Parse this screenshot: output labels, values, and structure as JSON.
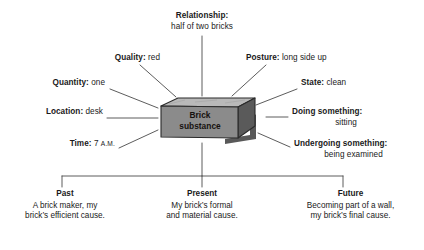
{
  "diagram": {
    "title_subject": {
      "line1": "Brick",
      "line2": "substance"
    },
    "radial_labels": [
      {
        "id": "relationship",
        "term": "Relationship:",
        "value": "half of two bricks",
        "position": "top-center",
        "layout": "stacked"
      },
      {
        "id": "quality",
        "term": "Quality:",
        "value": "red",
        "position": "upper-left",
        "layout": "inline"
      },
      {
        "id": "posture",
        "term": "Posture:",
        "value": "long side up",
        "position": "upper-right",
        "layout": "inline"
      },
      {
        "id": "quantity",
        "term": "Quantity:",
        "value": "one",
        "position": "left",
        "layout": "inline"
      },
      {
        "id": "state",
        "term": "State:",
        "value": "clean",
        "position": "right",
        "layout": "inline"
      },
      {
        "id": "location",
        "term": "Location:",
        "value": "desk",
        "position": "mid-left",
        "layout": "inline"
      },
      {
        "id": "doing-something",
        "term": "Doing something:",
        "value": "sitting",
        "position": "mid-right",
        "layout": "stacked"
      },
      {
        "id": "time",
        "term": "Time:",
        "value": "7",
        "value_smallcaps": "A.M.",
        "position": "lower-left",
        "layout": "inline"
      },
      {
        "id": "undergoing-something",
        "term": "Undergoing something:",
        "value": "being examined",
        "position": "lower-right",
        "layout": "stacked"
      }
    ],
    "time_branches": [
      {
        "id": "past",
        "heading": "Past",
        "line1": "A brick maker, my",
        "line2": "brick’s efficient cause."
      },
      {
        "id": "present",
        "heading": "Present",
        "line1": "My brick’s formal",
        "line2": "and material cause."
      },
      {
        "id": "future",
        "heading": "Future",
        "line1": "Becoming part of a wall,",
        "line2": "my brick’s final cause."
      }
    ],
    "colors": {
      "background": "#ffffff",
      "text": "#1a1a1a",
      "line": "#4a4a4a",
      "brick_front": "#8b8b8b",
      "brick_top": "#b9b9b9",
      "brick_side": "#5a5a5a",
      "brick_outline": "#2b2b2b",
      "brick_shadow": "#3c3c3c"
    }
  }
}
